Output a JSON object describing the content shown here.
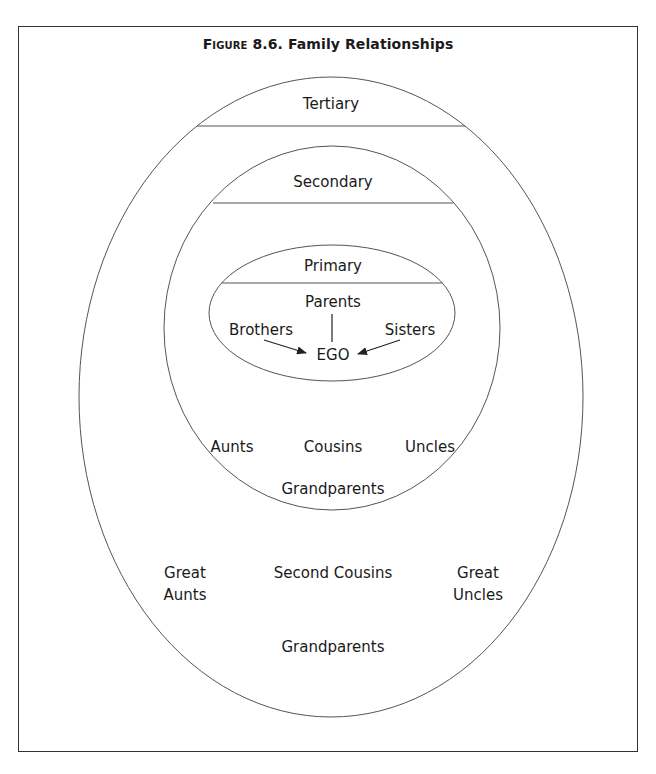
{
  "figure": {
    "number_prefix": "Figure",
    "number": "8.6.",
    "title": "Family Relationships"
  },
  "circles": {
    "tertiary": {
      "label": "Tertiary",
      "members": {
        "great_aunts_line1": "Great",
        "great_aunts_line2": "Aunts",
        "second_cousins": "Second Cousins",
        "great_uncles_line1": "Great",
        "great_uncles_line2": "Uncles",
        "grandparents": "Grandparents"
      }
    },
    "secondary": {
      "label": "Secondary",
      "members": {
        "aunts": "Aunts",
        "cousins": "Cousins",
        "uncles": "Uncles",
        "grandparents": "Grandparents"
      }
    },
    "primary": {
      "label": "Primary",
      "members": {
        "parents": "Parents",
        "brothers": "Brothers",
        "sisters": "Sisters",
        "ego": "EGO"
      }
    }
  },
  "colors": {
    "stroke": "#555555",
    "text": "#1a1a1a",
    "background": "#ffffff"
  }
}
